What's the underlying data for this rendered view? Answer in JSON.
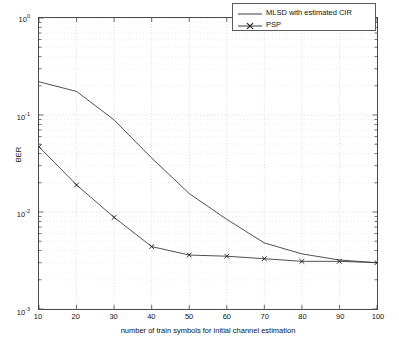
{
  "chart_data": {
    "type": "line",
    "title": "",
    "xlabel": "number of train symbols for initial channel estimation",
    "ylabel": "BER",
    "xlim": [
      10,
      100
    ],
    "ylim": [
      0.001,
      1
    ],
    "yscale": "log",
    "xscale": "linear",
    "grid": true,
    "grid_style": "dotted",
    "legend_position": "upper right",
    "xticks": [
      "10",
      "20",
      "30",
      "40",
      "50",
      "60",
      "70",
      "80",
      "90",
      "100"
    ],
    "xtick_values": [
      10,
      20,
      30,
      40,
      50,
      60,
      70,
      80,
      90,
      100
    ],
    "yticks": [
      "10",
      "10",
      "10",
      "10"
    ],
    "ytick_exponents": [
      "0",
      "-1",
      "-2",
      "-3"
    ],
    "ytick_values": [
      1,
      0.1,
      0.01,
      0.001
    ],
    "x": [
      10,
      20,
      30,
      40,
      50,
      60,
      70,
      80,
      90,
      100
    ],
    "series": [
      {
        "name": "MLSD with estimated CIR",
        "marker": "none",
        "color": "#3a3a3a",
        "values": [
          0.22,
          0.175,
          0.089,
          0.036,
          0.0155,
          0.0084,
          0.0048,
          0.0037,
          0.0032,
          0.003
        ]
      },
      {
        "name": "PSP",
        "marker": "x",
        "color": "#3a3a3a",
        "values": [
          0.047,
          0.019,
          0.0088,
          0.0044,
          0.0036,
          0.0035,
          0.0033,
          0.0031,
          0.0031,
          0.003
        ]
      }
    ]
  },
  "axes": {
    "ylabel": "BER",
    "xlabel": "number of train symbols for initial channel estimation",
    "ybase": "10"
  },
  "legend": {
    "entries": [
      {
        "label": "MLSD with estimated CIR",
        "marker": "line"
      },
      {
        "label": "PSP",
        "marker": "line-x"
      }
    ]
  },
  "colors": {
    "axis": "#4a4a4a",
    "grid": "#c9c9c9",
    "series": "#3a3a3a",
    "background": "#ffffff"
  }
}
